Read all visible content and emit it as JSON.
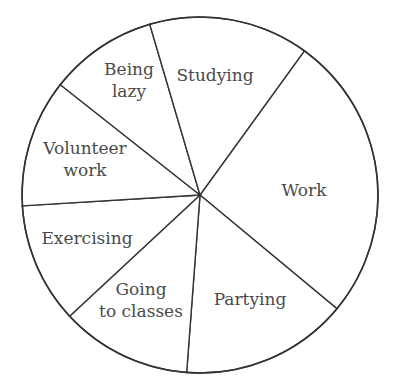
{
  "chart_data": {
    "type": "pie",
    "title": "",
    "legend": "none (labels inside slices)",
    "center": [
      200,
      195
    ],
    "radius": 178,
    "start_angle_deg": -54.1,
    "slices": [
      {
        "label": "Work",
        "lines": [
          "Work"
        ],
        "angle_deg": 93.8,
        "approx_percent": 26.1,
        "label_pos": [
          304,
          190
        ]
      },
      {
        "label": "Partying",
        "lines": [
          "Partying"
        ],
        "angle_deg": 54.6,
        "approx_percent": 15.2,
        "label_pos": [
          250,
          299
        ]
      },
      {
        "label": "Going to classes",
        "lines": [
          "Going",
          "to classes"
        ],
        "angle_deg": 42.8,
        "approx_percent": 11.9,
        "label_pos": [
          141,
          300
        ]
      },
      {
        "label": "Exercising",
        "lines": [
          "Exercising"
        ],
        "angle_deg": 39.4,
        "approx_percent": 10.9,
        "label_pos": [
          87,
          238
        ]
      },
      {
        "label": "Volunteer work",
        "lines": [
          "Volunteer",
          "work"
        ],
        "angle_deg": 41.8,
        "approx_percent": 11.6,
        "label_pos": [
          85,
          159
        ]
      },
      {
        "label": "Being lazy",
        "lines": [
          "Being",
          "lazy"
        ],
        "angle_deg": 35.3,
        "approx_percent": 9.8,
        "label_pos": [
          129,
          80
        ]
      },
      {
        "label": "Studying",
        "lines": [
          "Studying"
        ],
        "angle_deg": 52.3,
        "approx_percent": 14.5,
        "label_pos": [
          215,
          75
        ]
      }
    ],
    "colors": {
      "fill": "#ffffff",
      "stroke": "#333333",
      "text": "#4a4a4a"
    }
  }
}
